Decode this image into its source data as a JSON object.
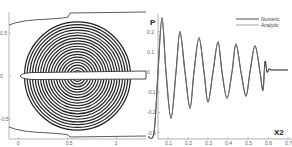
{
  "chart_data": [
    {
      "type": "contour",
      "title": "",
      "xlabel": "",
      "ylabel": "",
      "x_ticks": [
        "0",
        "0.5",
        "1"
      ],
      "y_ticks": [
        "0.5",
        "0",
        "-0.5"
      ],
      "xlim": [
        -0.1,
        1.3
      ],
      "ylim": [
        -0.75,
        0.75
      ],
      "description": "Concentric circular pressure contours centered near (0.6, 0) with a thin airfoil-like body along y=0 and curved boundaries top and bottom",
      "contour_center": [
        0.6,
        0.0
      ],
      "contour_rings": 20,
      "contour_max_radius": 0.6
    },
    {
      "type": "line",
      "title": "",
      "xlabel": "X2",
      "ylabel": "P",
      "x_ticks": [
        "0.1",
        "0.2",
        "0.3",
        "0.4",
        "0.5",
        "0.6",
        "0.7"
      ],
      "y_ticks": [
        "0.2",
        "0.1",
        "0",
        "-0.1",
        "-0.2",
        "-0.3"
      ],
      "xlim": [
        0.0,
        0.7
      ],
      "ylim": [
        -0.32,
        0.3
      ],
      "grid": false,
      "legend_position": "top-right",
      "series": [
        {
          "name": "Numeric",
          "x": [
            0.0,
            0.03,
            0.05,
            0.07,
            0.09,
            0.115,
            0.14,
            0.16,
            0.185,
            0.21,
            0.23,
            0.255,
            0.28,
            0.3,
            0.325,
            0.35,
            0.37,
            0.395,
            0.42,
            0.44,
            0.465,
            0.49,
            0.51,
            0.535,
            0.56,
            0.575,
            0.585,
            0.595,
            0.605,
            0.62,
            0.7
          ],
          "y": [
            -0.32,
            -0.3,
            0.0,
            0.27,
            0.0,
            -0.23,
            0.0,
            0.2,
            0.0,
            -0.18,
            0.0,
            0.17,
            0.0,
            -0.15,
            0.0,
            0.15,
            0.0,
            -0.13,
            0.0,
            0.14,
            0.0,
            -0.12,
            0.0,
            0.13,
            0.0,
            -0.09,
            0.05,
            0.0,
            0.015,
            0.01,
            0.01
          ]
        },
        {
          "name": "Analytic",
          "x": [
            0.0,
            0.03,
            0.05,
            0.07,
            0.09,
            0.115,
            0.14,
            0.16,
            0.185,
            0.21,
            0.23,
            0.255,
            0.28,
            0.3,
            0.325,
            0.35,
            0.37,
            0.395,
            0.42,
            0.44,
            0.465,
            0.49,
            0.51,
            0.535,
            0.56,
            0.575,
            0.585,
            0.595,
            0.605,
            0.62,
            0.7
          ],
          "y": [
            -0.32,
            -0.3,
            0.0,
            0.265,
            0.0,
            -0.225,
            0.0,
            0.198,
            0.0,
            -0.178,
            0.0,
            0.168,
            0.0,
            -0.148,
            0.0,
            0.148,
            0.0,
            -0.128,
            0.0,
            0.138,
            0.0,
            -0.118,
            0.0,
            0.128,
            0.0,
            -0.088,
            0.04,
            0.005,
            0.012,
            0.01,
            0.01
          ]
        }
      ]
    }
  ]
}
